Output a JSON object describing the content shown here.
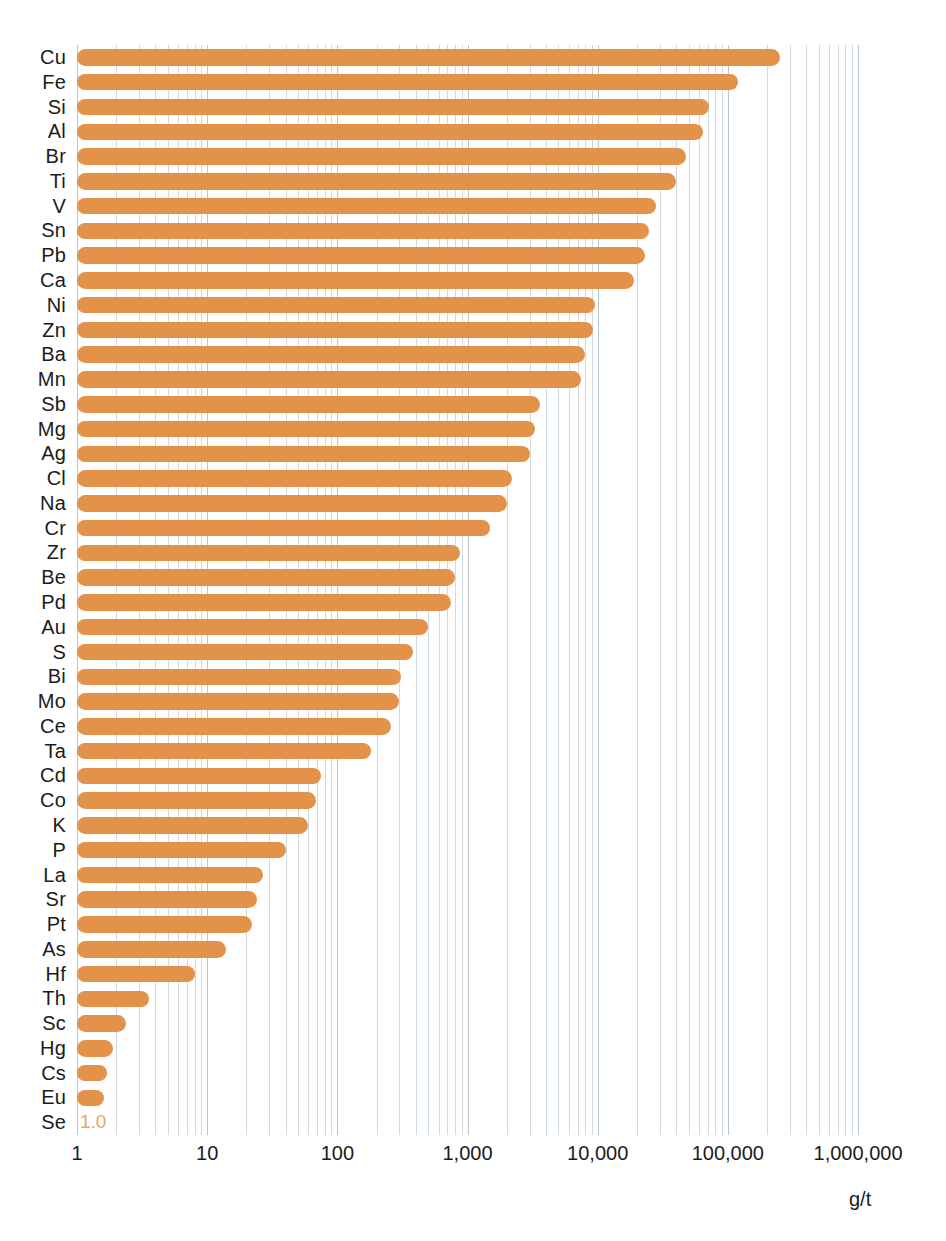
{
  "chart_data": {
    "type": "bar",
    "orientation": "horizontal",
    "title": "",
    "xlabel": "g/t",
    "ylabel": "",
    "xscale": "log",
    "xlim": [
      1,
      1000000
    ],
    "xticks": [
      1,
      10,
      100,
      1000,
      10000,
      100000,
      1000000
    ],
    "xtick_labels": [
      "1",
      "10",
      "100",
      "1,000",
      "10,000",
      "100,000",
      "1,000,000"
    ],
    "grid": true,
    "grid_minor": true,
    "legend": null,
    "bar_color": "#e3924a",
    "categories": [
      "Cu",
      "Fe",
      "Si",
      "Al",
      "Br",
      "Ti",
      "V",
      "Sn",
      "Pb",
      "Ca",
      "Ni",
      "Zn",
      "Ba",
      "Mn",
      "Sb",
      "Mg",
      "Ag",
      "Cl",
      "Na",
      "Cr",
      "Zr",
      "Be",
      "Pd",
      "Au",
      "S",
      "Bi",
      "Mo",
      "Ce",
      "Ta",
      "Cd",
      "Co",
      "K",
      "P",
      "La",
      "Sr",
      "Pt",
      "As",
      "Hf",
      "Th",
      "Sc",
      "Hg",
      "Cs",
      "Eu",
      "Se"
    ],
    "values": [
      250000,
      120000,
      72000,
      65000,
      48000,
      40000,
      28000,
      25000,
      23000,
      19000,
      9500,
      9200,
      8000,
      7500,
      3600,
      3300,
      3000,
      2200,
      2000,
      1500,
      880,
      800,
      750,
      500,
      380,
      310,
      300,
      260,
      180,
      75,
      68,
      60,
      40,
      27,
      24,
      22,
      14,
      8,
      3.6,
      2.4,
      1.9,
      1.7,
      1.6,
      1.0
    ],
    "value_labels": {
      "Se": "1.0"
    },
    "label_color": "#e8a75f"
  },
  "axis": {
    "unit_label": "g/t"
  },
  "caption": {
    "text": ""
  }
}
